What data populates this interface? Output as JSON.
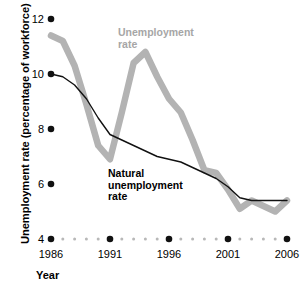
{
  "chart_data": {
    "type": "line",
    "title": "",
    "xlabel": "Year",
    "ylabel": "Unemployment rate (percentage of workforce)",
    "xlim": [
      1986,
      2006
    ],
    "ylim": [
      4,
      12
    ],
    "grid": false,
    "legend_position": "inline-annotations",
    "x_ticks": [
      "1986",
      "1991",
      "1996",
      "2001",
      "2006"
    ],
    "y_ticks": [
      "12",
      "10",
      "8",
      "6",
      "4"
    ],
    "x": [
      1986,
      1987,
      1988,
      1989,
      1990,
      1991,
      1992,
      1993,
      1994,
      1995,
      1996,
      1997,
      1998,
      1999,
      2000,
      2001,
      2002,
      2003,
      2004,
      2005,
      2006
    ],
    "series": [
      {
        "name": "Unemployment rate",
        "color": "#b3b3b3",
        "values": [
          11.4,
          11.2,
          10.3,
          8.9,
          7.4,
          6.9,
          8.6,
          10.4,
          10.8,
          9.9,
          9.1,
          8.6,
          7.6,
          6.5,
          6.4,
          5.8,
          5.1,
          5.4,
          5.2,
          5.0,
          5.4
        ]
      },
      {
        "name": "Natural unemployment rate",
        "color": "#111111",
        "values": [
          10.0,
          9.9,
          9.6,
          9.1,
          8.4,
          7.8,
          7.6,
          7.4,
          7.2,
          7.0,
          6.9,
          6.8,
          6.6,
          6.4,
          6.2,
          5.9,
          5.5,
          5.4,
          5.4,
          5.4,
          5.4
        ]
      }
    ],
    "annotations": [
      {
        "text": "Unemployment rate",
        "color": "#a6a6a6"
      },
      {
        "text": "Natural unemployment rate",
        "color": "#000000"
      }
    ]
  },
  "axes": {
    "y_title": "Unemployment rate (percentage of workforce)",
    "x_title": "Year",
    "y_ticks": [
      {
        "label": "12",
        "value": 12
      },
      {
        "label": "10",
        "value": 10
      },
      {
        "label": "8",
        "value": 8
      },
      {
        "label": "6",
        "value": 6
      },
      {
        "label": "4",
        "value": 4
      }
    ],
    "x_ticks": [
      {
        "label": "1986",
        "value": 1986
      },
      {
        "label": "1991",
        "value": 1991
      },
      {
        "label": "1996",
        "value": 1996
      },
      {
        "label": "2001",
        "value": 2001
      },
      {
        "label": "2006",
        "value": 2006
      }
    ]
  },
  "labels": {
    "unemployment_line1": "Unemployment",
    "unemployment_line2": "rate",
    "natural_line1": "Natural",
    "natural_line2": "unemployment",
    "natural_line3": "rate"
  },
  "colors": {
    "unemployment_rate": "#b3b3b3",
    "natural_rate": "#111111",
    "tick_dot": "#111111",
    "minor_dot": "#b8b8b8",
    "background": "#ffffff"
  }
}
